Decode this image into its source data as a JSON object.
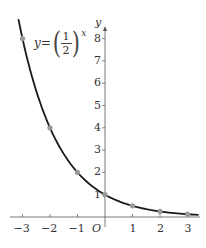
{
  "chart_data": {
    "type": "line",
    "title": "",
    "function_label": {
      "lhs": "y=",
      "numerator": "1",
      "denominator": "2",
      "exponent": "x"
    },
    "xlabel": "",
    "ylabel": "y",
    "origin_label": "O",
    "x_ticks": [
      -3,
      -2,
      -1,
      1,
      2,
      3
    ],
    "x_tick_labels": [
      "−3",
      "−2",
      "−1",
      "1",
      "2",
      "3"
    ],
    "y_ticks": [
      1,
      2,
      3,
      4,
      5,
      6,
      7,
      8
    ],
    "y_tick_labels": [
      "1",
      "2",
      "3",
      "4",
      "5",
      "6",
      "7",
      "8"
    ],
    "xlim": [
      -3.7,
      3.4
    ],
    "ylim": [
      0,
      8.6
    ],
    "grid": false,
    "series": [
      {
        "name": "y=(1/2)^x",
        "x": [
          -3,
          -2,
          -1,
          0,
          1,
          2,
          3
        ],
        "values": [
          8,
          4,
          2,
          1,
          0.5,
          0.25,
          0.125
        ],
        "markers": true
      }
    ],
    "colors": {
      "curve": "#1a1a1a",
      "markers": "#9a9a9a",
      "axes": "#555555"
    }
  }
}
